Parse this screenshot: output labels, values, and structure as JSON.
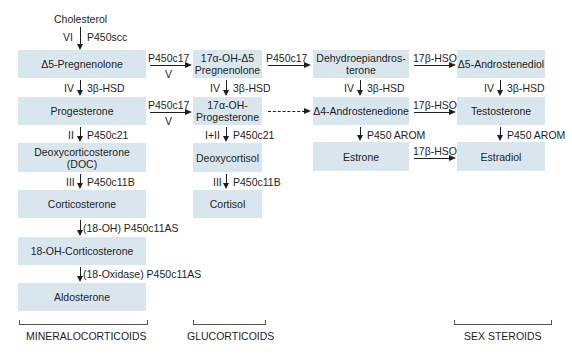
{
  "start": {
    "label": "Cholesterol",
    "enzyme_num": "VI",
    "enzyme": "P450scc"
  },
  "column_mineralocorticoid": {
    "boxes": [
      "Δ5-Pregnenolone",
      "Progesterone",
      "Deoxycorticosterone (DOC)",
      "Corticosterone",
      "18-OH-Corticosterone",
      "Aldosterone"
    ],
    "steps": [
      {
        "num": "IV",
        "enzyme": "3β-HSD"
      },
      {
        "num": "II",
        "enzyme": "P450c21"
      },
      {
        "num": "III",
        "enzyme": "P450c11B"
      },
      {
        "num": "",
        "enzyme": "(18-OH) P450c11AS"
      },
      {
        "num": "",
        "enzyme": "(18-Oxidase) P450c11AS"
      }
    ]
  },
  "column_glucocorticoid": {
    "boxes": [
      "17α-OH-Δ5 Pregnenolone",
      "17α-OH-Progesterone",
      "Deoxycortisol",
      "Cortisol"
    ],
    "box_lines": [
      [
        "17α-OH-Δ5",
        "Pregnenolone"
      ],
      [
        "17α-OH-",
        "Progesterone"
      ],
      [
        "Deoxycortisol"
      ],
      [
        "Cortisol"
      ]
    ],
    "steps": [
      {
        "num": "IV",
        "enzyme": "3β-HSD"
      },
      {
        "num": "I+II",
        "enzyme": "P450c21"
      },
      {
        "num": "III",
        "enzyme": "P450c11B"
      }
    ]
  },
  "column_androgen": {
    "boxes": [
      "Dehydroepiandrosterone",
      "Δ4-Androstenedione",
      "Estrone"
    ],
    "box_lines": [
      [
        "Dehydroepiandros-",
        "terone"
      ],
      [
        "Δ4-Androstenedione"
      ],
      [
        "Estrone"
      ]
    ],
    "steps": [
      {
        "num": "IV",
        "enzyme": "3β-HSD"
      },
      {
        "num": "",
        "enzyme": "P450 AROM"
      }
    ]
  },
  "column_sex": {
    "boxes": [
      "Δ5-Androstenediol",
      "Testosterone",
      "Estradiol"
    ],
    "steps": [
      {
        "num": "IV",
        "enzyme": "3β-HSD"
      },
      {
        "num": "",
        "enzyme": "P450 AROM"
      }
    ]
  },
  "horizontal_arrows": {
    "c1_c2_row1": {
      "enzyme": "P450c17",
      "num": "V"
    },
    "c1_c2_row2": {
      "enzyme": "P450c17",
      "num": "V"
    },
    "c2_c3_row1": {
      "enzyme": "P450c17"
    },
    "c2_c3_row2": {
      "style": "dashed"
    },
    "c3_c4_row1": {
      "enzyme": "17β-HSO"
    },
    "c3_c4_row2": {
      "enzyme": "17β-HSO"
    },
    "c3_c4_row3": {
      "enzyme": "17β-HSO"
    }
  },
  "groups": [
    "MINERALOCORTICOIDS",
    "GLUCORTICOIDS",
    "SEX STEROIDS"
  ],
  "colors": {
    "box_fill": "#d9e6ee",
    "text": "#1e1e1e"
  }
}
